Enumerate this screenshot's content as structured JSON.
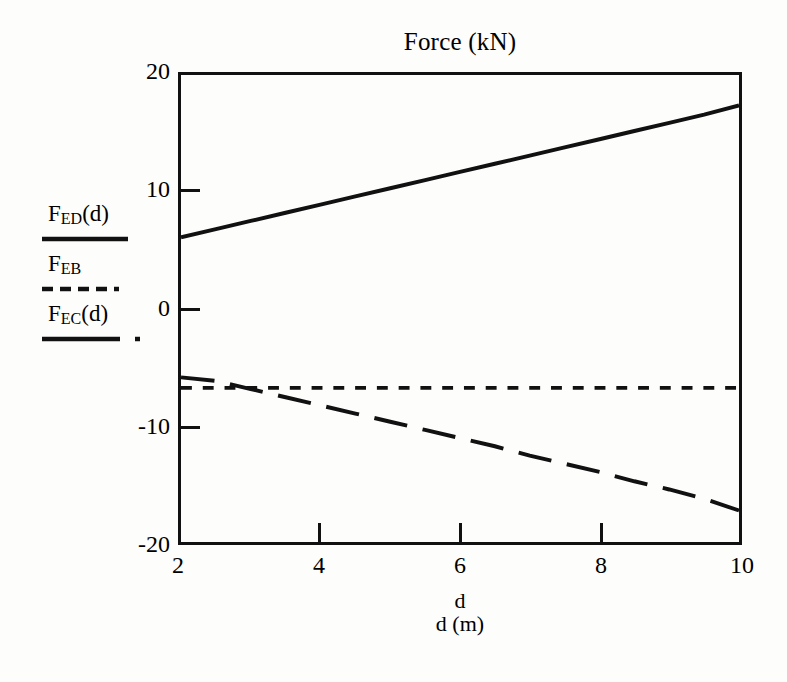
{
  "chart_data": {
    "type": "line",
    "title": "Force (kN)",
    "xlabel": "d (m)",
    "xlabel_top": "d",
    "ylabel": "",
    "xlim": [
      2,
      10
    ],
    "ylim": [
      -20,
      20
    ],
    "xticks": [
      2,
      4,
      6,
      8,
      10
    ],
    "xtick_labels": [
      "2",
      "4",
      "6",
      "8",
      "10"
    ],
    "yticks": [
      20,
      10,
      0,
      -10,
      -20
    ],
    "ytick_labels": [
      "20",
      "10",
      "0",
      "-10",
      "-20"
    ],
    "grid": false,
    "legend_position": "left-outside",
    "series": [
      {
        "name": "F_ED(d)",
        "label_main": "F",
        "label_sub": "ED",
        "label_suffix": "(d)",
        "style": "solid",
        "color": "#111111",
        "x": [
          2,
          2.5,
          3,
          3.5,
          4,
          4.5,
          5,
          5.5,
          6,
          6.5,
          7,
          7.5,
          8,
          8.5,
          9,
          9.5,
          10
        ],
        "y": [
          6.1,
          6.8,
          7.5,
          8.2,
          8.9,
          9.6,
          10.3,
          11.0,
          11.7,
          12.4,
          13.1,
          13.8,
          14.5,
          15.2,
          15.9,
          16.6,
          17.4
        ]
      },
      {
        "name": "F_EB",
        "label_main": "F",
        "label_sub": "EB",
        "label_suffix": "",
        "style": "dashed",
        "color": "#111111",
        "x": [
          2,
          10
        ],
        "y": [
          -6.8,
          -6.8
        ]
      },
      {
        "name": "F_EC(d)",
        "label_main": "F",
        "label_sub": "EC",
        "label_suffix": "(d)",
        "style": "dashdot",
        "color": "#111111",
        "x": [
          2,
          2.5,
          3,
          3.5,
          4,
          4.5,
          5,
          5.5,
          6,
          6.5,
          7,
          7.5,
          8,
          8.5,
          9,
          9.5,
          10
        ],
        "y": [
          -5.9,
          -6.2,
          -6.9,
          -7.6,
          -8.3,
          -9.0,
          -9.7,
          -10.4,
          -11.1,
          -11.8,
          -12.6,
          -13.3,
          -14.0,
          -14.8,
          -15.5,
          -16.3,
          -17.3
        ]
      }
    ]
  },
  "chart": {
    "title": "Force (kN)",
    "xaxis_caption_top": "d",
    "xaxis_caption": "d (m)"
  },
  "legend": {
    "entries": [
      {
        "main": "F",
        "sub": "ED",
        "suffix": "(d)"
      },
      {
        "main": "F",
        "sub": "EB",
        "suffix": ""
      },
      {
        "main": "F",
        "sub": "EC",
        "suffix": "(d)"
      }
    ]
  }
}
